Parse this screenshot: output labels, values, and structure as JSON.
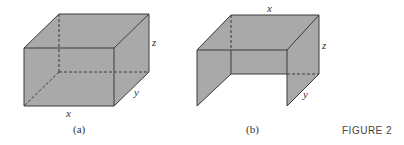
{
  "figure": {
    "caption": "FIGURE 2",
    "panels": [
      {
        "id": "a",
        "subcaption": "(a)",
        "description": "Closed rectangular box with dimensions x, y, z",
        "labels": {
          "x": "x",
          "y": "y",
          "z": "z"
        }
      },
      {
        "id": "b",
        "subcaption": "(b)",
        "description": "Open box with top, back, and two side panels; front and bottom absent",
        "labels": {
          "x": "x",
          "y": "y",
          "z": "z"
        }
      }
    ],
    "colors": {
      "face": "#a9a9a9",
      "edge": "#3a3a3a"
    }
  }
}
